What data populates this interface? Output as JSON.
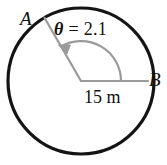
{
  "figure": {
    "colors": {
      "circle_stroke": "#141414",
      "radius_stroke": "#9a9a9a",
      "arc_stroke": "#9a9a9a",
      "text": "#111111",
      "background": "#ffffff"
    },
    "geometry": {
      "center_x": 81,
      "center_y": 81,
      "circle_radius_px": 73,
      "arc_radius_px": 40,
      "angle_start_deg": 0,
      "angle_end_deg": 120,
      "point_a_angle_deg": 120,
      "point_b_angle_deg": 0
    },
    "labels": {
      "point_a": "A",
      "point_b": "B",
      "angle_symbol": "θ",
      "angle_equals": " = ",
      "angle_value": "2.1",
      "radius_length": "15 m"
    }
  }
}
